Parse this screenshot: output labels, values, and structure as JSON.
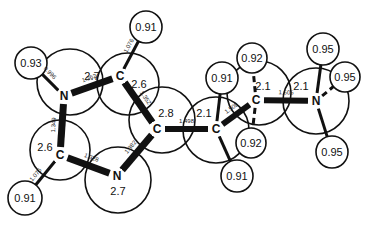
{
  "heavy_atoms": [
    {
      "id": "N1",
      "element": "N",
      "shell_value": "2.7"
    },
    {
      "id": "C2",
      "element": "C",
      "shell_value": "2.6"
    },
    {
      "id": "C4",
      "element": "C",
      "shell_value": "2.8"
    },
    {
      "id": "N3",
      "element": "N",
      "shell_value": "2.7"
    },
    {
      "id": "C5",
      "element": "C",
      "shell_value": "2.6"
    },
    {
      "id": "Cb",
      "element": "C",
      "shell_value": "2.1"
    },
    {
      "id": "Ca",
      "element": "C",
      "shell_value": "2.1"
    },
    {
      "id": "Nplus",
      "element": "N",
      "shell_value": "2.1"
    }
  ],
  "hydrogens": [
    {
      "id": "H_N1",
      "parent": "N1",
      "value": "0.93"
    },
    {
      "id": "H_C2",
      "parent": "C2",
      "value": "0.91"
    },
    {
      "id": "H_C5",
      "parent": "C5",
      "value": "0.91"
    },
    {
      "id": "H_Cb1",
      "parent": "Cb",
      "value": "0.91"
    },
    {
      "id": "H_Cb2",
      "parent": "Cb",
      "value": "0.91"
    },
    {
      "id": "H_Ca1",
      "parent": "Ca",
      "value": "0.92"
    },
    {
      "id": "H_Ca2",
      "parent": "Ca",
      "value": "0.92"
    },
    {
      "id": "H_N1p",
      "parent": "Nplus",
      "value": "0.95"
    },
    {
      "id": "H_N2p",
      "parent": "Nplus",
      "value": "0.95"
    },
    {
      "id": "H_N3p",
      "parent": "Nplus",
      "value": "0.95"
    }
  ],
  "bonds": [
    {
      "from": "N1",
      "to": "H_N1",
      "length": "0.996"
    },
    {
      "from": "N1",
      "to": "C2",
      "length": "1.362"
    },
    {
      "from": "C2",
      "to": "H_C2",
      "length": "1.076"
    },
    {
      "from": "C2",
      "to": "C4",
      "length": "1.352"
    },
    {
      "from": "C4",
      "to": "N3",
      "length": "1.382"
    },
    {
      "from": "N3",
      "to": "C5",
      "length": "1.328"
    },
    {
      "from": "C5",
      "to": "N1",
      "length": "1.349"
    },
    {
      "from": "C5",
      "to": "H_C5",
      "length": "1.076"
    },
    {
      "from": "C4",
      "to": "Cb",
      "length": "1.498"
    },
    {
      "from": "Cb",
      "to": "Ca",
      "length": "1.509"
    },
    {
      "from": "Ca",
      "to": "Nplus",
      "length": "1.505"
    }
  ]
}
